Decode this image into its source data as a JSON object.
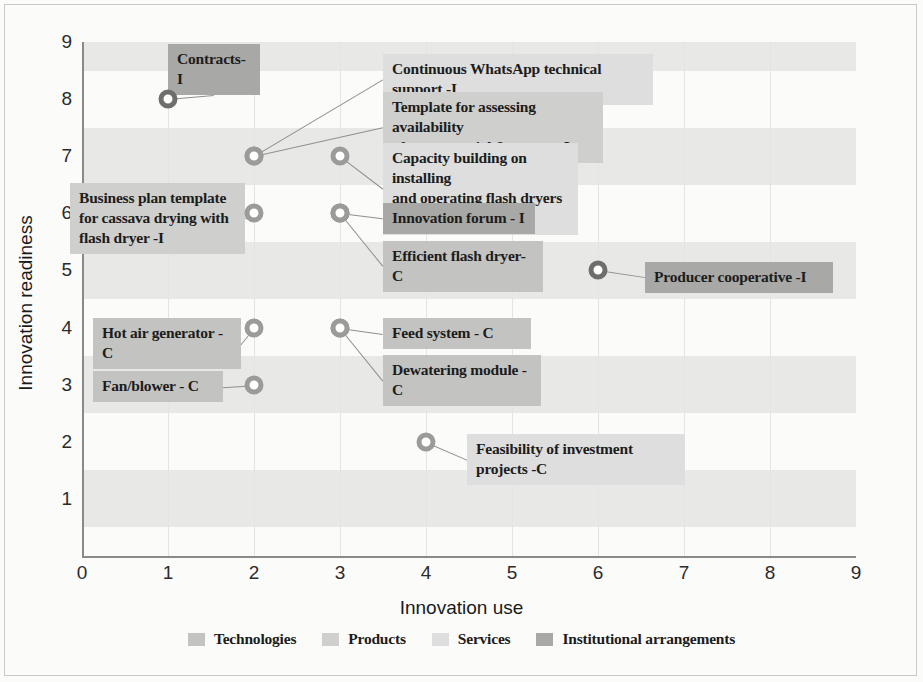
{
  "chart_data": {
    "type": "scatter",
    "title": "",
    "xlabel": "Innovation use",
    "ylabel": "Innovation readiness",
    "xlim": [
      0,
      9
    ],
    "ylim": [
      0,
      9
    ],
    "xticks": [
      "0",
      "1",
      "2",
      "3",
      "4",
      "5",
      "6",
      "7",
      "8",
      "9"
    ],
    "yticks": [
      "1",
      "2",
      "3",
      "4",
      "5",
      "6",
      "7",
      "8",
      "9"
    ],
    "grid": "horizontal-bands",
    "legend_position": "bottom-center",
    "points": [
      {
        "label": "Contracts-I",
        "x": 1,
        "y": 8,
        "category": "Institutional arrangements"
      },
      {
        "label": "Continuous WhatsApp technical support -I",
        "x": 2,
        "y": 7,
        "category": "Services"
      },
      {
        "label": "Template for assessing availability\nof raw material & energy -I",
        "x": 2,
        "y": 7,
        "category": "Products"
      },
      {
        "label": "Capacity building on installing\nand operating flash dryers -I",
        "x": 3,
        "y": 7,
        "category": "Services"
      },
      {
        "label": "Business plan template\nfor cassava drying with\nflash dryer -I",
        "x": 2,
        "y": 6,
        "category": "Products"
      },
      {
        "label": "Innovation forum - I",
        "x": 3,
        "y": 6,
        "category": "Institutional arrangements"
      },
      {
        "label": "Efficient flash dryer- C",
        "x": 3,
        "y": 6,
        "category": "Technologies"
      },
      {
        "label": "Producer cooperative -I",
        "x": 6,
        "y": 5,
        "category": "Institutional arrangements"
      },
      {
        "label": "Hot air generator -C",
        "x": 2,
        "y": 4,
        "category": "Technologies"
      },
      {
        "label": "Feed system - C",
        "x": 3,
        "y": 4,
        "category": "Technologies"
      },
      {
        "label": "Dewatering module - C",
        "x": 3,
        "y": 4,
        "category": "Technologies"
      },
      {
        "label": "Fan/blower - C",
        "x": 2,
        "y": 3,
        "category": "Technologies"
      },
      {
        "label": "Feasibility of investment projects -C",
        "x": 4,
        "y": 2,
        "category": "Services"
      }
    ],
    "legend": [
      {
        "name": "Technologies",
        "color": "#c3c3c1"
      },
      {
        "name": "Products",
        "color": "#cfcfcd"
      },
      {
        "name": "Services",
        "color": "#dedede"
      },
      {
        "name": "Institutional arrangements",
        "color": "#a8a8a6"
      }
    ]
  },
  "axes": {
    "x_title": "Innovation use",
    "y_title": "Innovation readiness",
    "x_ticks": [
      "0",
      "1",
      "2",
      "3",
      "4",
      "5",
      "6",
      "7",
      "8",
      "9"
    ],
    "y_ticks": [
      "9",
      "8",
      "7",
      "6",
      "5",
      "4",
      "3",
      "2",
      "1"
    ]
  },
  "labels": {
    "contracts": "Contracts-I",
    "whatsapp": "Continuous WhatsApp technical support -I",
    "template_raw": "Template for assessing availability\nof raw material & energy -I",
    "capacity": "Capacity building on installing\nand operating flash dryers -I",
    "business_plan": "Business plan template\nfor cassava drying with\nflash dryer -I",
    "innovation_forum": "Innovation forum - I",
    "efficient_dryer": "Efficient flash dryer- C",
    "producer_coop": "Producer cooperative -I",
    "hot_air": "Hot air generator -C",
    "feed_system": "Feed system - C",
    "dewatering": "Dewatering module - C",
    "fan_blower": "Fan/blower - C",
    "feasibility": "Feasibility of investment projects -C"
  },
  "legend": {
    "items": [
      {
        "label": "Technologies"
      },
      {
        "label": "Products"
      },
      {
        "label": "Services"
      },
      {
        "label": "Institutional arrangements"
      }
    ]
  }
}
